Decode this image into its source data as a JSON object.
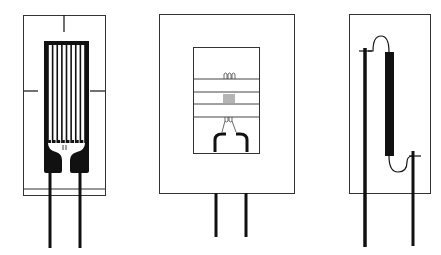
{
  "figure": {
    "colors": {
      "ink": "#111111",
      "background": "#ffffff",
      "frame": "#333333"
    },
    "gauges": [
      {
        "id": "foil-gauge",
        "type": "bonded foil strain gauge",
        "grid_fingers": 8,
        "leads": 2
      },
      {
        "id": "thin-film-gauge",
        "type": "thin-film / windowed gauge",
        "leads": 2
      },
      {
        "id": "semiconductor-gauge",
        "type": "semiconductor bar strain gauge",
        "leads": 2
      }
    ]
  }
}
